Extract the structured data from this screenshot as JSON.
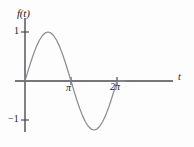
{
  "figure": {
    "caption": "",
    "axis_color": "#4a4a52",
    "curve_color": "#8c8c94",
    "background": "#fdfdfd"
  },
  "labels": {
    "y_axis": "f(t)",
    "x_axis": "t",
    "y_tick_positive": "1",
    "y_tick_negative": "−1",
    "x_tick_pi": "π",
    "x_tick_two": "2",
    "x_tick_two_pi_symbol": "π"
  },
  "chart_data": {
    "type": "line",
    "title": "",
    "xlabel": "t",
    "ylabel": "f(t)",
    "function": "sin(t)",
    "xlim": [
      -0.45,
      6.85
    ],
    "ylim": [
      -1.45,
      1.45
    ],
    "grid": false,
    "legend": null,
    "xticks": [
      3.14159,
      6.28319
    ],
    "xticklabels": [
      "π",
      "2π"
    ],
    "yticks": [
      1,
      -1
    ],
    "yticklabels": [
      "1",
      "−1"
    ],
    "series": [
      {
        "name": "sin(t)",
        "x": [
          0.0,
          0.1963,
          0.3927,
          0.589,
          0.7854,
          0.9817,
          1.1781,
          1.3744,
          1.5708,
          1.7671,
          1.9635,
          2.1598,
          2.3562,
          2.5525,
          2.7489,
          2.9452,
          3.1416,
          3.3379,
          3.5343,
          3.7306,
          3.927,
          4.1233,
          4.3197,
          4.516,
          4.7124,
          4.9087,
          5.1051,
          5.3014,
          5.4978,
          5.6941,
          5.8905,
          6.0868,
          6.2832
        ],
        "y": [
          0.0,
          0.195,
          0.383,
          0.556,
          0.707,
          0.831,
          0.924,
          0.981,
          1.0,
          0.981,
          0.924,
          0.831,
          0.707,
          0.556,
          0.383,
          0.195,
          0.0,
          -0.195,
          -0.383,
          -0.556,
          -0.707,
          -0.831,
          -0.924,
          -0.981,
          -1.0,
          -0.981,
          -0.924,
          -0.831,
          -0.707,
          -0.556,
          -0.383,
          -0.195,
          0.0
        ]
      },
      {
        "name": "zero-extension",
        "x": [
          6.2832,
          6.85
        ],
        "y": [
          0.0,
          0.0
        ]
      }
    ]
  }
}
